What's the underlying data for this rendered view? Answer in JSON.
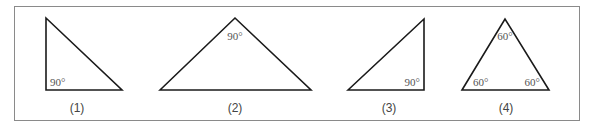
{
  "figure": {
    "triangles": [
      {
        "caption": "(1)",
        "angles": [
          "90°"
        ]
      },
      {
        "caption": "(2)",
        "angles": [
          "90°"
        ]
      },
      {
        "caption": "(3)",
        "angles": [
          "90°"
        ]
      },
      {
        "caption": "(4)",
        "angles": [
          "60°",
          "60°",
          "60°"
        ]
      }
    ],
    "colors": {
      "stroke": "#1a1a1a",
      "frame": "#8a8a8a",
      "text": "#555555"
    }
  }
}
